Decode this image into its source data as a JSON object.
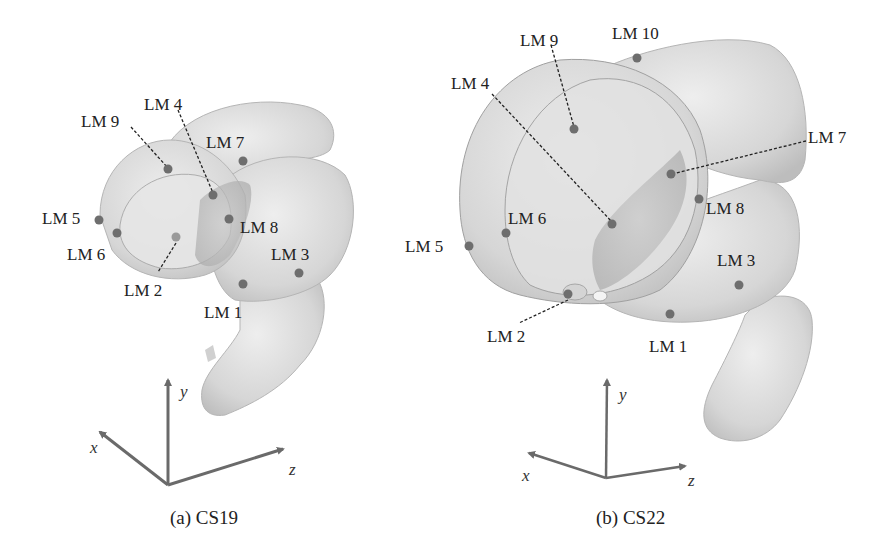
{
  "panels": [
    {
      "id": "a",
      "caption": "(a) CS19",
      "landmarks": {
        "lm1": "LM 1",
        "lm2": "LM 2",
        "lm3": "LM 3",
        "lm4": "LM 4",
        "lm5": "LM 5",
        "lm6": "LM 6",
        "lm7": "LM 7",
        "lm8": "LM 8",
        "lm9": "LM 9"
      },
      "axes": {
        "x": "x",
        "y": "y",
        "z": "z"
      }
    },
    {
      "id": "b",
      "caption": "(b) CS22",
      "landmarks": {
        "lm1": "LM 1",
        "lm2": "LM 2",
        "lm3": "LM 3",
        "lm4": "LM 4",
        "lm5": "LM 5",
        "lm6": "LM 6",
        "lm7": "LM 7",
        "lm8": "LM 8",
        "lm9": "LM 9",
        "lm10": "LM 10"
      },
      "axes": {
        "x": "x",
        "y": "y",
        "z": "z"
      }
    }
  ],
  "colors": {
    "tissue": "#d9d9d9",
    "tissue_edge": "#9a9a9a",
    "landmark": "#6e6e6e",
    "axis": "#6a6a6a"
  }
}
